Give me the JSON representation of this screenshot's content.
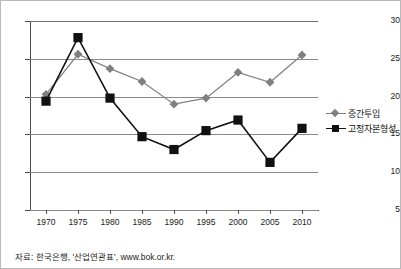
{
  "chart_data": {
    "type": "line",
    "title": "",
    "xlabel": "",
    "ylabel": "",
    "categories": [
      "1970",
      "1975",
      "1980",
      "1985",
      "1990",
      "1995",
      "2000",
      "2005",
      "2010"
    ],
    "ylim": [
      5,
      30
    ],
    "yticks": [
      "5",
      "10",
      "15",
      "20",
      "25",
      "30"
    ],
    "grid": true,
    "legend_position": "right",
    "series": [
      {
        "name": "중간투입",
        "color": "#808080",
        "marker": "diamond",
        "values": [
          20.3,
          25.6,
          23.7,
          22.0,
          19.0,
          19.8,
          23.2,
          21.9,
          25.5
        ]
      },
      {
        "name": "고정자본형성",
        "color": "#111111",
        "marker": "square",
        "values": [
          19.4,
          27.8,
          19.8,
          14.7,
          13.0,
          15.5,
          16.9,
          11.3,
          15.8
        ]
      }
    ]
  },
  "source": {
    "note": "자료: 한국은행, '산업연관표', www.bok.or.kr."
  }
}
